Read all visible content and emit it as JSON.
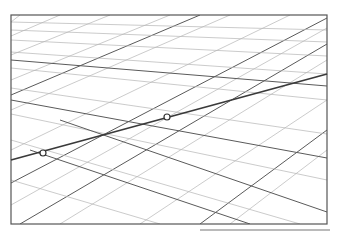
{
  "diagram": {
    "frame": {
      "x1": 11,
      "y1": 15,
      "x2": 327,
      "y2": 224
    },
    "colors": {
      "light_grid": "#b4b4b4",
      "dark_grid": "#5a5a5a",
      "frame": "#555555",
      "line": "#3a3a3a"
    },
    "main_line": {
      "x1": 11,
      "y1": 160,
      "x2": 327,
      "y2": 74
    },
    "markers": [
      {
        "name": "point-a",
        "x": 43,
        "y": 153
      },
      {
        "name": "point-b",
        "x": 167,
        "y": 117
      }
    ]
  }
}
